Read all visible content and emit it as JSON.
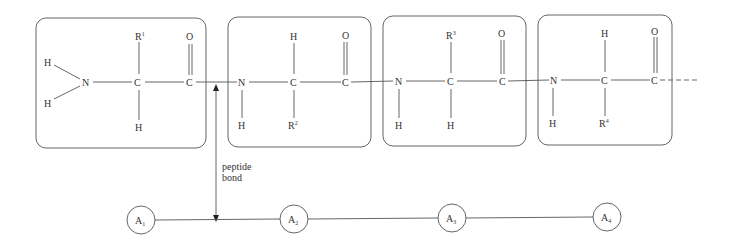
{
  "diagram": {
    "residues": [
      {
        "box": {
          "x": 36,
          "y": 18,
          "w": 170,
          "h": 130
        },
        "n_label": "N",
        "ca_label": "C",
        "c_label": "C",
        "o_label": "O",
        "top_label": "R",
        "top_sup": "1",
        "bottom_label": "H",
        "n_h_labels": [
          "H",
          "H"
        ],
        "type": "terminal"
      },
      {
        "box": {
          "x": 228,
          "y": 17,
          "w": 143,
          "h": 130
        },
        "n_label": "N",
        "ca_label": "C",
        "c_label": "C",
        "o_label": "O",
        "top_label": "H",
        "bottom_label": "R",
        "bottom_sup": "2",
        "n_h_label": "H"
      },
      {
        "box": {
          "x": 383,
          "y": 16,
          "w": 143,
          "h": 130
        },
        "n_label": "N",
        "ca_label": "C",
        "c_label": "C",
        "o_label": "O",
        "top_label": "R",
        "top_sup": "3",
        "bottom_label": "H",
        "n_h_label": "H"
      },
      {
        "box": {
          "x": 538,
          "y": 15,
          "w": 134,
          "h": 130
        },
        "n_label": "N",
        "ca_label": "C",
        "c_label": "C",
        "o_label": "O",
        "top_label": "H",
        "bottom_label": "R",
        "bottom_sup": "4",
        "n_h_label": "H"
      }
    ],
    "peptide_bond_label_line1": "peptide",
    "peptide_bond_label_line2": "bond",
    "chain_nodes": [
      {
        "label": "A",
        "sub": "1",
        "cx": 141
      },
      {
        "label": "A",
        "sub": "2",
        "cx": 294
      },
      {
        "label": "A",
        "sub": "3",
        "cx": 452
      },
      {
        "label": "A",
        "sub": "4",
        "cx": 607
      }
    ]
  }
}
